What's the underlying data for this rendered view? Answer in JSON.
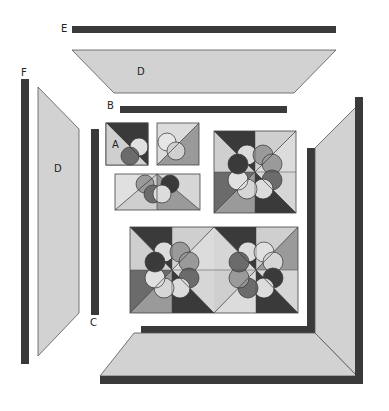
{
  "diagram": {
    "type": "quilt-assembly",
    "colors": {
      "dark": "#3a3a3a",
      "medium_dark": "#6b6b6b",
      "medium": "#9a9a9a",
      "light": "#c9c9c9",
      "lighter": "#dcdcdc",
      "outline": "#444444",
      "background": "#ffffff"
    },
    "labels": {
      "E": "E",
      "D_top": "D",
      "F": "F",
      "D_left": "D",
      "B": "B",
      "A": "A",
      "C": "C"
    },
    "pieces": [
      {
        "id": "E",
        "shape": "border-strip",
        "position": "top-outer",
        "color": "dark"
      },
      {
        "id": "D",
        "shape": "trapezoid",
        "position": "top",
        "color": "light"
      },
      {
        "id": "F",
        "shape": "border-strip",
        "position": "left-outer",
        "color": "dark"
      },
      {
        "id": "D",
        "shape": "trapezoid",
        "position": "left",
        "color": "light"
      },
      {
        "id": "B",
        "shape": "border-strip",
        "position": "top-inner",
        "color": "dark"
      },
      {
        "id": "C",
        "shape": "border-strip",
        "position": "left-inner",
        "color": "dark"
      },
      {
        "id": "A",
        "shape": "quarter-block",
        "position": "assembly-step-1"
      },
      {
        "id": "half-block",
        "shape": "half-block",
        "position": "assembly-step-2"
      },
      {
        "id": "full-block",
        "shape": "flower-block",
        "position": "assembly-step-3"
      },
      {
        "id": "two-block-row",
        "shape": "block-row",
        "count": 2,
        "position": "assembly-step-4"
      },
      {
        "id": "joined-border",
        "shape": "mitered-corner",
        "position": "bottom-right"
      }
    ]
  }
}
